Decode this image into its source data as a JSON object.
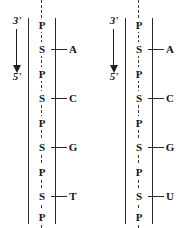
{
  "figure": {
    "panels": [
      {
        "id": "dna-strand",
        "direction": {
          "top_label": "3'",
          "bottom_label": "5'",
          "arrow": "down-arrow-icon"
        },
        "backbone": [
          {
            "type": "phosphate",
            "label": "P",
            "base": null
          },
          {
            "type": "sugar",
            "label": "S",
            "base": "A"
          },
          {
            "type": "phosphate",
            "label": "P",
            "base": null
          },
          {
            "type": "sugar",
            "label": "S",
            "base": "C"
          },
          {
            "type": "phosphate",
            "label": "P",
            "base": null
          },
          {
            "type": "sugar",
            "label": "S",
            "base": "G"
          },
          {
            "type": "phosphate",
            "label": "P",
            "base": null
          },
          {
            "type": "sugar",
            "label": "S",
            "base": "T"
          },
          {
            "type": "phosphate",
            "label": "P",
            "base": null
          }
        ]
      },
      {
        "id": "rna-strand",
        "direction": {
          "top_label": "3'",
          "bottom_label": "5'",
          "arrow": "down-arrow-icon"
        },
        "backbone": [
          {
            "type": "phosphate",
            "label": "P",
            "base": null
          },
          {
            "type": "sugar",
            "label": "S",
            "base": "A"
          },
          {
            "type": "phosphate",
            "label": "P",
            "base": null
          },
          {
            "type": "sugar",
            "label": "S",
            "base": "C"
          },
          {
            "type": "phosphate",
            "label": "P",
            "base": null
          },
          {
            "type": "sugar",
            "label": "S",
            "base": "G"
          },
          {
            "type": "phosphate",
            "label": "P",
            "base": null
          },
          {
            "type": "sugar",
            "label": "S",
            "base": "U"
          },
          {
            "type": "phosphate",
            "label": "P",
            "base": null
          }
        ]
      }
    ],
    "colors": {
      "ink": "#151515",
      "line": "#2a2a2a",
      "background": "#ffffff"
    }
  }
}
